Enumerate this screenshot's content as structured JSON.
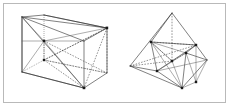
{
  "figure": {
    "caption": "",
    "frame": {
      "border_color": "#b9b9b9",
      "background_color": "#ffffff"
    },
    "style": {
      "solid_edge_color": "#2b2b2b",
      "dashed_edge_color": "#3a3a3a",
      "thin_edge_color": "#5a5a5a",
      "vertex_color": "#1a1a1a"
    },
    "panels": [
      {
        "id": "left-panel",
        "name": "cube-with-inscribed-polyhedron",
        "label": "",
        "shape_type": "cube",
        "vertices": {
          "front_bottom_left": [
            22,
            72
          ],
          "front_bottom_right": [
            84,
            88
          ],
          "front_top_left": [
            22,
            17
          ],
          "front_top_right": [
            84,
            41
          ],
          "back_bottom_left": [
            44,
            60
          ],
          "back_bottom_right": [
            107,
            73
          ],
          "back_top_left": [
            44,
            15
          ],
          "back_top_right": [
            107,
            28
          ]
        },
        "solid_edges": [
          [
            "front_top_left",
            "front_top_right"
          ],
          [
            "front_top_right",
            "front_bottom_right"
          ],
          [
            "front_bottom_right",
            "front_bottom_left"
          ],
          [
            "front_bottom_left",
            "front_top_left"
          ],
          [
            "front_top_left",
            "back_top_left"
          ],
          [
            "front_top_right",
            "back_top_right"
          ],
          [
            "front_bottom_right",
            "back_bottom_right"
          ],
          [
            "back_top_left",
            "back_top_right"
          ],
          [
            "back_top_right",
            "back_bottom_right"
          ]
        ],
        "hidden_edges": [
          [
            "back_bottom_left",
            "back_bottom_right"
          ],
          [
            "back_bottom_left",
            "back_top_left"
          ],
          [
            "front_bottom_left",
            "back_bottom_left"
          ]
        ],
        "inscribed_solid_edges": [
          [
            "front_top_left",
            "back_top_right"
          ],
          [
            "front_top_left",
            "front_bottom_left"
          ],
          [
            "front_top_left",
            "front_bottom_right"
          ],
          [
            "front_bottom_left",
            "front_bottom_right"
          ],
          [
            "back_top_left",
            "back_top_right"
          ]
        ],
        "inscribed_dashed_edges": [
          [
            "front_top_left",
            "back_bottom_right"
          ],
          [
            "back_top_right",
            "front_bottom_right"
          ],
          [
            "back_top_right",
            "back_bottom_left"
          ],
          [
            "back_bottom_left",
            "front_bottom_right"
          ],
          [
            "back_bottom_left",
            "back_bottom_right"
          ],
          [
            "back_top_right",
            "back_bottom_right"
          ]
        ]
      },
      {
        "id": "right-panel",
        "name": "triangulated-polyhedron",
        "label": "",
        "shape_type": "tetrahedron",
        "vertices": {
          "apex": [
            172,
            13
          ],
          "left": [
            130,
            66
          ],
          "mid_left": [
            151,
            42
          ],
          "mid_right": [
            196,
            45
          ],
          "lower_mid": [
            157,
            71
          ],
          "bottom": [
            182,
            88
          ],
          "right": [
            207,
            60
          ],
          "inner_center": [
            172,
            61
          ],
          "inner_upper": [
            186,
            53
          ]
        },
        "solid_edges": [
          [
            "apex",
            "left"
          ],
          [
            "apex",
            "mid_left"
          ],
          [
            "apex",
            "mid_right"
          ],
          [
            "mid_left",
            "mid_right"
          ],
          [
            "left",
            "lower_mid"
          ],
          [
            "left",
            "bottom"
          ],
          [
            "lower_mid",
            "bottom"
          ],
          [
            "bottom",
            "right"
          ],
          [
            "mid_right",
            "right"
          ],
          [
            "mid_left",
            "lower_mid"
          ],
          [
            "right",
            "inner_upper"
          ],
          [
            "mid_right",
            "inner_upper"
          ],
          [
            "inner_upper",
            "bottom"
          ]
        ],
        "inner_solid_edges": [
          [
            "mid_left",
            "inner_upper"
          ],
          [
            "mid_left",
            "bottom"
          ],
          [
            "lower_mid",
            "mid_right"
          ],
          [
            "lower_mid",
            "inner_upper"
          ],
          [
            "inner_center",
            "mid_right"
          ],
          [
            "inner_center",
            "apex"
          ],
          [
            "inner_center",
            "bottom"
          ],
          [
            "inner_center",
            "mid_left"
          ]
        ],
        "inner_dashed_edges": [
          [
            "mid_left",
            "inner_center"
          ],
          [
            "left",
            "inner_center"
          ],
          [
            "inner_center",
            "inner_upper"
          ],
          [
            "left",
            "mid_right"
          ],
          [
            "mid_left",
            "mid_right"
          ],
          [
            "lower_mid",
            "inner_center"
          ]
        ]
      }
    ]
  }
}
